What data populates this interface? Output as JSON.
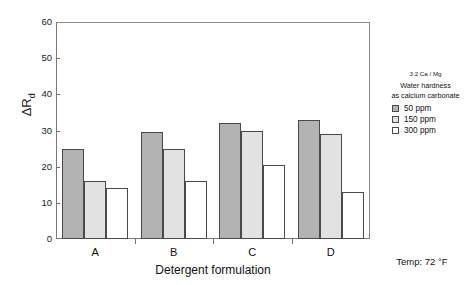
{
  "chart_data": {
    "type": "bar",
    "title": "",
    "xlabel": "Detergent formulation",
    "ylabel": "ΔR",
    "ylabel_sub": "d",
    "categories": [
      "A",
      "B",
      "C",
      "D"
    ],
    "series": [
      {
        "name": "50 ppm",
        "values": [
          25,
          29.5,
          32,
          33
        ],
        "swatch": "#b3b3b3"
      },
      {
        "name": "150 ppm",
        "values": [
          16,
          25,
          30,
          29
        ],
        "swatch": "#e2e2e2"
      },
      {
        "name": "300 ppm",
        "values": [
          14,
          16,
          20.5,
          13
        ],
        "swatch": "#ffffff"
      }
    ],
    "ylim": [
      0,
      60
    ],
    "yticks": [
      0,
      10,
      20,
      30,
      40,
      50,
      60
    ],
    "grid": false,
    "legend_position": "right"
  },
  "legend": {
    "ratio": "3:2 Ca / Mg",
    "title_line1": "Water hardness",
    "title_line2": "as calcium carbonate"
  },
  "annotation": {
    "temp": "Temp: 72 °F"
  }
}
